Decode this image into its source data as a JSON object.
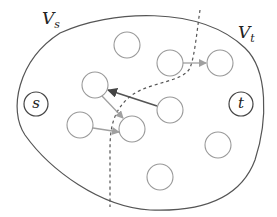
{
  "diagram": {
    "type": "flow-network-cut",
    "colors": {
      "outline": "#555555",
      "node_stroke": "#999999",
      "special_node_stroke": "#444444",
      "arrow_light": "#a0a0a0",
      "arrow_dark": "#555555",
      "cut_line": "#555555"
    },
    "sets": [
      {
        "id": "Vs",
        "base": "V",
        "sub": "s",
        "x": 42,
        "y": 12
      },
      {
        "id": "Vt",
        "base": "V",
        "sub": "t",
        "x": 240,
        "y": 26
      }
    ],
    "special_nodes": [
      {
        "id": "s",
        "label": "s",
        "cx": 36,
        "cy": 104,
        "r": 12
      },
      {
        "id": "t",
        "label": "t",
        "cx": 241,
        "cy": 104,
        "r": 12
      }
    ],
    "nodes": [
      {
        "id": "n1",
        "cx": 127,
        "cy": 45,
        "r": 13
      },
      {
        "id": "n2",
        "cx": 170,
        "cy": 63,
        "r": 13
      },
      {
        "id": "n3",
        "cx": 220,
        "cy": 63,
        "r": 13
      },
      {
        "id": "n4",
        "cx": 95,
        "cy": 85,
        "r": 13
      },
      {
        "id": "n5",
        "cx": 170,
        "cy": 110,
        "r": 13
      },
      {
        "id": "n6",
        "cx": 80,
        "cy": 125,
        "r": 13
      },
      {
        "id": "n7",
        "cx": 132,
        "cy": 129,
        "r": 13
      },
      {
        "id": "n8",
        "cx": 218,
        "cy": 145,
        "r": 13
      },
      {
        "id": "n9",
        "cx": 160,
        "cy": 177,
        "r": 13
      }
    ],
    "edges": [
      {
        "from": "n2",
        "to": "n3",
        "x1": 183,
        "y1": 63,
        "x2": 206,
        "y2": 63,
        "style": "light"
      },
      {
        "from": "n5",
        "to": "n4",
        "x1": 157,
        "y1": 106,
        "x2": 108,
        "y2": 90,
        "style": "dark"
      },
      {
        "from": "n4",
        "to": "n7",
        "x1": 102,
        "y1": 96,
        "x2": 123,
        "y2": 118,
        "style": "light"
      },
      {
        "from": "n6",
        "to": "n7",
        "x1": 93,
        "y1": 128,
        "x2": 119,
        "y2": 132,
        "style": "light"
      }
    ],
    "outline_path": "M 60 33 C 110 10, 200 5, 245 48 C 268 70, 268 120, 255 160 C 240 200, 200 212, 150 210 C 100 207, 50 170, 25 135 C 8 110, 18 60, 60 33 Z",
    "cut_path": "M 200 10 C 197 30, 195 55, 190 68 C 183 82, 150 82, 132 95 C 112 110, 110 130, 110 150 C 110 175, 110 195, 110 207"
  }
}
